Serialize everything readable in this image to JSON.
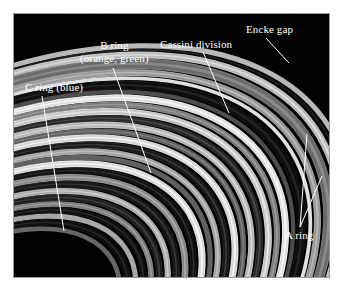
{
  "figure": {
    "kind": "annotated-photograph",
    "frame": {
      "background_color": "#000000",
      "border_color": "#9a9a9a",
      "page_color": "#ffffff"
    }
  },
  "annotations": {
    "label_color": "#ffffff",
    "leader_color": "#ffffff",
    "items": [
      {
        "id": "c-ring",
        "name": "c-ring-label",
        "line1": "C ring (blue)",
        "line2": "",
        "leader": {
          "x1": 42,
          "y1": 96,
          "x2": 64,
          "y2": 231
        }
      },
      {
        "id": "b-ring",
        "name": "b-ring-label",
        "line1": "B ring",
        "line2": "(orange, green)",
        "leader": {
          "x1": 113,
          "y1": 68,
          "x2": 151,
          "y2": 173
        }
      },
      {
        "id": "cassini-division",
        "name": "cassini-division-label",
        "line1": "Cassini division",
        "line2": "",
        "leader": {
          "x1": 203,
          "y1": 52,
          "x2": 229,
          "y2": 113
        }
      },
      {
        "id": "encke-gap",
        "name": "encke-gap-label",
        "line1": "Encke gap",
        "line2": "",
        "leader": {
          "x1": 266,
          "y1": 38,
          "x2": 289,
          "y2": 63
        }
      },
      {
        "id": "a-ring",
        "name": "a-ring-label",
        "line1": "A ring",
        "line2": "",
        "leader": {
          "x1": 307,
          "y1": 134,
          "x2": 300,
          "y2": 227
        },
        "leader2": {
          "x1": 322,
          "y1": 176,
          "x2": 300,
          "y2": 227
        }
      }
    ]
  },
  "image_content": {
    "description": "Close-up oblique view of Saturn's rings showing concentric bright and dark bands curving from upper-right to lower-left",
    "ring_bands": [
      {
        "name": "outer-a-ring-edge",
        "offset": 0.04,
        "width": 0.022,
        "brightness": 0.72
      },
      {
        "name": "encke-gap",
        "offset": 0.066,
        "width": 0.01,
        "brightness": 0.1
      },
      {
        "name": "a-ring-outer",
        "offset": 0.082,
        "width": 0.03,
        "brightness": 0.8
      },
      {
        "name": "a-ring-mid",
        "offset": 0.118,
        "width": 0.046,
        "brightness": 0.48
      },
      {
        "name": "a-ring-inner",
        "offset": 0.17,
        "width": 0.03,
        "brightness": 0.66
      },
      {
        "name": "a-ring-inner-edge",
        "offset": 0.205,
        "width": 0.016,
        "brightness": 0.88
      },
      {
        "name": "cassini-division",
        "offset": 0.228,
        "width": 0.04,
        "brightness": 0.07
      },
      {
        "name": "cassini-inner-ramp",
        "offset": 0.272,
        "width": 0.018,
        "brightness": 0.3
      },
      {
        "name": "b-ring-outer-bright",
        "offset": 0.296,
        "width": 0.03,
        "brightness": 0.94
      },
      {
        "name": "b-ring-band-1",
        "offset": 0.332,
        "width": 0.026,
        "brightness": 0.55
      },
      {
        "name": "b-ring-band-2",
        "offset": 0.364,
        "width": 0.03,
        "brightness": 0.84
      },
      {
        "name": "b-ring-dark-1",
        "offset": 0.4,
        "width": 0.026,
        "brightness": 0.22
      },
      {
        "name": "b-ring-band-3",
        "offset": 0.432,
        "width": 0.028,
        "brightness": 0.78
      },
      {
        "name": "b-ring-band-4",
        "offset": 0.466,
        "width": 0.024,
        "brightness": 0.44
      },
      {
        "name": "b-ring-band-5",
        "offset": 0.496,
        "width": 0.03,
        "brightness": 0.9
      },
      {
        "name": "b-ring-dark-2",
        "offset": 0.532,
        "width": 0.028,
        "brightness": 0.16
      },
      {
        "name": "b-ring-band-6",
        "offset": 0.566,
        "width": 0.026,
        "brightness": 0.7
      },
      {
        "name": "b-ring-band-7",
        "offset": 0.598,
        "width": 0.022,
        "brightness": 0.38
      },
      {
        "name": "b-ring-inner-bright",
        "offset": 0.626,
        "width": 0.03,
        "brightness": 0.92
      },
      {
        "name": "b-c-boundary",
        "offset": 0.662,
        "width": 0.026,
        "brightness": 0.12
      },
      {
        "name": "c-ring-band-1",
        "offset": 0.694,
        "width": 0.028,
        "brightness": 0.6
      },
      {
        "name": "c-ring-dark-1",
        "offset": 0.728,
        "width": 0.03,
        "brightness": 0.14
      },
      {
        "name": "c-ring-band-2",
        "offset": 0.764,
        "width": 0.026,
        "brightness": 0.74
      },
      {
        "name": "c-ring-dark-2",
        "offset": 0.796,
        "width": 0.028,
        "brightness": 0.18
      },
      {
        "name": "c-ring-band-3",
        "offset": 0.83,
        "width": 0.024,
        "brightness": 0.56
      },
      {
        "name": "c-ring-dark-3",
        "offset": 0.86,
        "width": 0.026,
        "brightness": 0.1
      },
      {
        "name": "c-ring-band-4",
        "offset": 0.892,
        "width": 0.022,
        "brightness": 0.66
      },
      {
        "name": "c-ring-inner-dark",
        "offset": 0.92,
        "width": 0.03,
        "brightness": 0.08
      },
      {
        "name": "innermost-band",
        "offset": 0.956,
        "width": 0.02,
        "brightness": 0.4
      }
    ]
  }
}
